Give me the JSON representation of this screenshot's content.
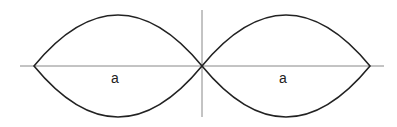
{
  "diagram": {
    "axes": {
      "horizontal": {
        "x1": 20,
        "x2": 384,
        "y": 66,
        "color": "#888888"
      },
      "vertical": {
        "x": 202,
        "y1": 10,
        "y2": 117,
        "color": "#888888"
      }
    },
    "lenses": [
      {
        "id": "left",
        "left_tip_x": 34,
        "right_tip_x": 202,
        "center_y": 66,
        "top_y": 15,
        "bottom_y": 118,
        "label": "a",
        "label_x": 115,
        "label_y": 83
      },
      {
        "id": "right",
        "left_tip_x": 202,
        "right_tip_x": 370,
        "center_y": 66,
        "top_y": 15,
        "bottom_y": 118,
        "label": "a",
        "label_x": 283,
        "label_y": 83
      }
    ],
    "stroke_color": "#222222"
  }
}
